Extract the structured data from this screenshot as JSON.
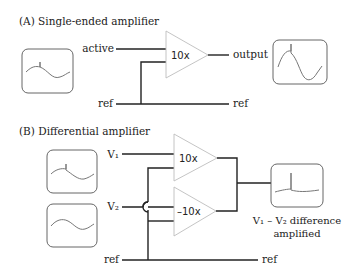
{
  "panel_a": {
    "title": "(A) Single-ended amplifier",
    "input_label": "active",
    "ref_label_left": "ref",
    "ref_label_right": "ref",
    "amplifier_gain": "10x",
    "output_label": "output"
  },
  "panel_b": {
    "title": "(B) Differential amplifier",
    "input1_label": "V₁",
    "input2_label": "V₂",
    "ref_label_left": "ref",
    "ref_label_right": "ref",
    "amplifier1_gain": "10x",
    "amplifier2_gain": "–10x",
    "caption_line1": "V₁ – V₂ difference",
    "caption_line2": "amplified"
  },
  "colors": {
    "wire": "#222222",
    "amplifier_outline": "#bdbdbd",
    "scope_outline": "#555555",
    "waveform": "#777777"
  }
}
